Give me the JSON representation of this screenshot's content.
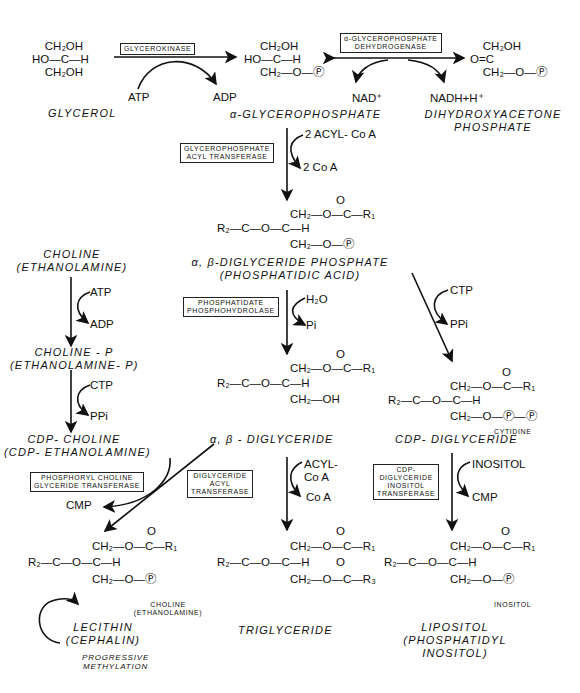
{
  "diagram": {
    "type": "metabolic-pathway",
    "topic": "Phospholipid and triglyceride biosynthesis"
  },
  "compounds": {
    "glycerol": {
      "name": "GLYCEROL",
      "struct": [
        "    CH₂OH",
        "HO—C—H",
        "    CH₂OH"
      ]
    },
    "alpha_glycerophosphate": {
      "name": "α-GLYCEROPHOSPHATE",
      "struct": [
        "     CH₂OH",
        "HO—C—H",
        "     CH₂—O—Ⓟ"
      ]
    },
    "dhap": {
      "name_line1": "DIHYDROXYACETONE",
      "name_line2": "PHOSPHATE",
      "struct": [
        "    CH₂OH",
        "O=C",
        "    CH₂—O—Ⓟ"
      ]
    },
    "phosphatidic_acid": {
      "name_line1": "α, β-DIGLYCERIDE PHOSPHATE",
      "name_line2": "(PHOSPHATIDIC ACID)"
    },
    "choline": {
      "name_line1": "CHOLINE",
      "name_line2": "(ETHANOLAMINE)"
    },
    "choline_p": {
      "name_line1": "CHOLINE - P",
      "name_line2": "(ETHANOLAMINE- P)"
    },
    "cdp_choline": {
      "name_line1": "CDP- CHOLINE",
      "name_line2": "(CDP- ETHANOLAMINE)"
    },
    "diglyceride": {
      "name": "α, β - DIGLYCERIDE"
    },
    "cdp_diglyceride": {
      "name": "CDP- DIGLYCERIDE",
      "sub_label": "CYTIDINE"
    },
    "lecithin": {
      "name_line1": "LECITHIN",
      "name_line2": "(CEPHALIN)",
      "sub_label_line1": "CHOLINE",
      "sub_label_line2": "(ETHANOLAMINE)"
    },
    "triglyceride": {
      "name": "TRIGLYCERIDE"
    },
    "lipositol": {
      "name_line1": "LIPOSITOL",
      "name_line2": "(PHOSPHATIDYL",
      "name_line3": "INOSITOL)",
      "sub_label": "INOSITOL"
    }
  },
  "enzymes": {
    "glycerokinase": "GLYCEROKINASE",
    "gp_dehydrogenase_1": "α-GLYCEROPHOSPHATE",
    "gp_dehydrogenase_2": "DEHYDROGENASE",
    "gp_acyl_transferase_1": "GLYCEROPHOSPHATE",
    "gp_acyl_transferase_2": "ACYL TRANSFERASE",
    "phosphohydrolase_1": "PHOSPHATIDATE",
    "phosphohydrolase_2": "PHOSPHOHYDROLASE",
    "pc_transferase_1": "PHOSPHORYL CHOLINE",
    "pc_transferase_2": "GLYCERIDE TRANSFERASE",
    "dg_acyl_transferase_1": "DIGLYCERIDE",
    "dg_acyl_transferase_2": "ACYL",
    "dg_acyl_transferase_3": "TRANSFERASE",
    "inositol_transferase_1": "CDP-",
    "inositol_transferase_2": "DIGLYCERIDE",
    "inositol_transferase_3": "INOSITOL",
    "inositol_transferase_4": "TRANSFERASE"
  },
  "cofactors": {
    "atp1": "ATP",
    "adp1": "ADP",
    "nad": "NAD⁺",
    "nadh": "NADH+H⁺",
    "acyl_coa_2": "2 ACYL- Co A",
    "coa_2": "2 Co A",
    "atp2": "ATP",
    "adp2": "ADP",
    "ctp1": "CTP",
    "ppi1": "PPi",
    "h2o": "H₂O",
    "pi": "Pi",
    "ctp2": "CTP",
    "ppi2": "PPi",
    "cmp1": "CMP",
    "acyl_coa_1": "ACYL-",
    "acyl_coa_2nd": "Co A",
    "coa_1": "Co A",
    "inositol": "INOSITOL",
    "cmp2": "CMP"
  },
  "annotations": {
    "methylation_1": "PROGRESSIVE",
    "methylation_2": "METHYLATION"
  },
  "structures": {
    "pa": [
      "                      O",
      "                      ‖",
      "        CH₂—O—C—R₁",
      "   O   |",
      "   ‖   |",
      "R₂—C—O—C—H",
      "        |",
      "        CH₂—O—Ⓟ"
    ],
    "dg_bottom": "CH₂—OH",
    "cdp_bottom": "CH₂—O—Ⓟ—Ⓟ",
    "lec_bottom": "CH₂—O—Ⓟ",
    "tg_bottom": "CH₂—O—C—R₃",
    "lip_bottom": "CH₂—O—Ⓟ",
    "top_chain": "CH₂—O—C—R₁",
    "mid_chain": "R₂—C—O—C—H",
    "carbonyl_o": "O"
  }
}
